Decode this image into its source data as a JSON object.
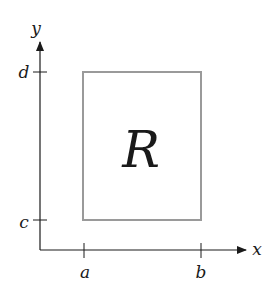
{
  "diagram": {
    "type": "rectangle region in xy-plane",
    "axes": {
      "x_label": "x",
      "y_label": "y"
    },
    "ticks": {
      "x": [
        "a",
        "b"
      ],
      "y": [
        "c",
        "d"
      ]
    },
    "region": {
      "label": "R",
      "x_range": [
        "a",
        "b"
      ],
      "y_range": [
        "c",
        "d"
      ]
    },
    "colors": {
      "axis": "#1a1a1a",
      "region_border": "#9a9a9a",
      "text": "#1a1a1a"
    }
  }
}
